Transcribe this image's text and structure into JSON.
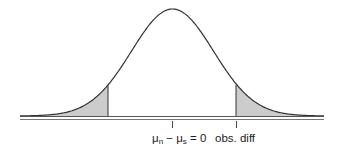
{
  "chart_data": {
    "type": "area",
    "title": "",
    "distribution": "normal",
    "mean": 0,
    "shaded_regions": [
      "left tail",
      "right tail"
    ],
    "annotations": [
      {
        "position": "center",
        "label": "μn − μs = 0"
      },
      {
        "position": "right cut",
        "label": "obs. diff"
      }
    ],
    "xlabel": "",
    "ylabel": "",
    "grid": false,
    "legend": null
  },
  "labels": {
    "null_value": {
      "mu1": "μ",
      "sub1": "n",
      "minus": " − ",
      "mu2": "μ",
      "sub2": "s",
      "eq": " = 0"
    },
    "obs_diff": "obs. diff"
  },
  "colors": {
    "curve": "#333333",
    "shade": "#cccccc",
    "axis": "#555555"
  }
}
